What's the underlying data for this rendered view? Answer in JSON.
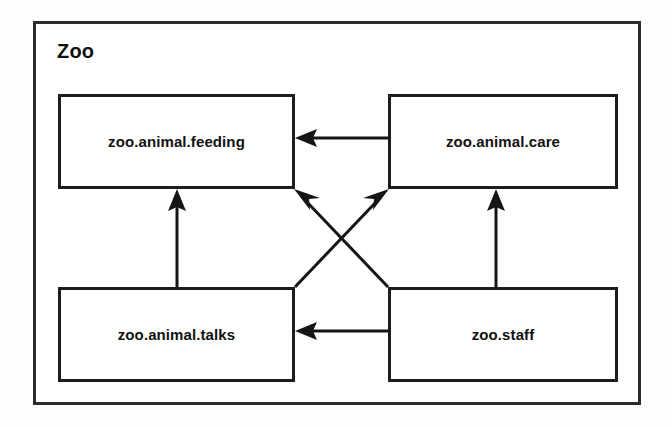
{
  "diagram": {
    "type": "uml-package-diagram",
    "package": {
      "name": "Zoo"
    },
    "nodes": [
      {
        "id": "feeding",
        "label": "zoo.animal.feeding",
        "position": "top-left"
      },
      {
        "id": "care",
        "label": "zoo.animal.care",
        "position": "top-right"
      },
      {
        "id": "talks",
        "label": "zoo.animal.talks",
        "position": "bottom-left"
      },
      {
        "id": "staff",
        "label": "zoo.staff",
        "position": "bottom-right"
      }
    ],
    "edges": [
      {
        "id": "care-to-feeding",
        "from": "care",
        "to": "feeding",
        "kind": "dependency",
        "direction": "left"
      },
      {
        "id": "talks-to-feeding",
        "from": "talks",
        "to": "feeding",
        "kind": "dependency",
        "direction": "up"
      },
      {
        "id": "staff-to-talks",
        "from": "staff",
        "to": "talks",
        "kind": "dependency",
        "direction": "left"
      },
      {
        "id": "staff-to-care",
        "from": "staff",
        "to": "care",
        "kind": "dependency",
        "direction": "up"
      },
      {
        "id": "talks-to-care",
        "from": "talks",
        "to": "care",
        "kind": "dependency",
        "direction": "up-right"
      },
      {
        "id": "staff-to-feeding",
        "from": "staff",
        "to": "feeding",
        "kind": "dependency",
        "direction": "up-left"
      }
    ],
    "colors": {
      "stroke": "#151515",
      "frame": "#2b2b2b",
      "background": "#ffffff",
      "text": "#111111"
    }
  }
}
